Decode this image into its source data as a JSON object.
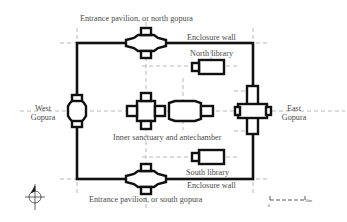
{
  "diagram": {
    "type": "architectural plan",
    "labels": {
      "north_gopura": "Entrance pavilion, or north gopura",
      "enclosure_wall_top": "Enclosure wall",
      "north_library": "North library",
      "west_gopura_1": "West",
      "west_gopura_2": "Gopura",
      "east_gopura_1": "East",
      "east_gopura_2": "Gopura",
      "inner_sanctuary": "Inner sanctuary and antechamber",
      "south_library": "South library",
      "enclosure_wall_bottom": "Enclosure wall",
      "south_gopura": "Entrance pavilion, or south gopura"
    },
    "scale_bar": {
      "start": "0",
      "end": "10m"
    },
    "north_arrow": "north-arrow",
    "colors": {
      "walls": "#111111",
      "guides": "#8a8a8a",
      "text": "#4a4a4a",
      "background": "#ffffff"
    }
  }
}
